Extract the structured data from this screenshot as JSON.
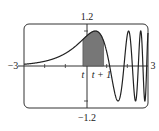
{
  "chart_data": {
    "type": "line",
    "title": "",
    "function": "sin(e^x)",
    "xlabel": "",
    "ylabel": "",
    "xlim": [
      -3,
      3
    ],
    "ylim": [
      -1.2,
      1.2
    ],
    "tick_labels": {
      "x_min": "−3",
      "x_max": "3",
      "y_max": "1.2",
      "y_min": "−1.2"
    },
    "annotations": {
      "left_bound": "t",
      "right_bound": "t + 1"
    },
    "shaded_region": {
      "from": -0.15,
      "to": 0.85,
      "label": "area between t and t+1 under curve"
    },
    "grid": false,
    "line_color": "#222222",
    "shade_color": "#777777"
  }
}
